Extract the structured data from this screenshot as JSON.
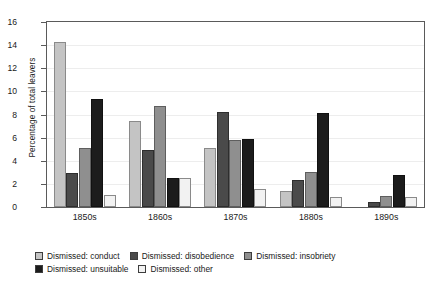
{
  "chart_data": {
    "type": "bar",
    "title": "",
    "xlabel": "",
    "ylabel": "Percentage of total leavers",
    "ylim": [
      0,
      16
    ],
    "ytick_step": 2,
    "yticks": [
      "0",
      "2",
      "4",
      "6",
      "8",
      "10",
      "12",
      "14",
      "16"
    ],
    "grid": true,
    "legend_position": "bottom-left",
    "categories": [
      "1850s",
      "1860s",
      "1870s",
      "1880s",
      "1890s"
    ],
    "series": [
      {
        "name": "Dismissed: conduct",
        "color": "#c4c4c4",
        "values": [
          14.25,
          7.45,
          5.1,
          1.4,
          0.0
        ]
      },
      {
        "name": "Dismissed: disobedience",
        "color": "#4a4a4a",
        "values": [
          2.95,
          4.9,
          8.2,
          2.35,
          0.45
        ]
      },
      {
        "name": "Dismissed: insobriety",
        "color": "#8f8f8f",
        "values": [
          5.1,
          8.7,
          5.8,
          3.05,
          0.95
        ]
      },
      {
        "name": "Dismissed: unsuitable",
        "color": "#1c1c1c",
        "values": [
          9.35,
          2.5,
          5.85,
          8.1,
          2.8
        ]
      },
      {
        "name": "Dismissed: other",
        "color": "#f2f2f2",
        "values": [
          1.05,
          2.5,
          1.6,
          0.85,
          0.9
        ]
      }
    ]
  }
}
